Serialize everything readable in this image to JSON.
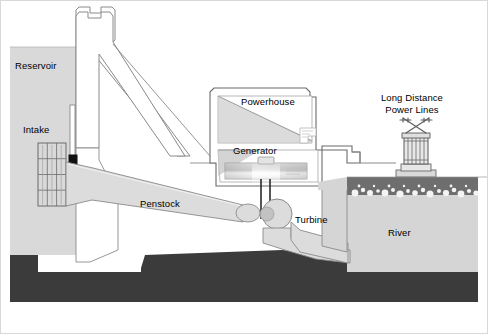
{
  "diagram": {
    "width": 488,
    "height": 334,
    "background": "#ffffff",
    "border_color": "#c8c8c8"
  },
  "labels": {
    "reservoir": "Reservoir",
    "intake": "Intake",
    "penstock": "Penstock",
    "powerhouse": "Powerhouse",
    "generator": "Generator",
    "turbine": "Turbine",
    "river": "River",
    "power_lines_line1": "Long Distance",
    "power_lines_line2": "Power Lines"
  },
  "colors": {
    "water_light": "#d9d9d9",
    "water_dark": "#6e6e6e",
    "bedrock": "#3b3b3b",
    "ground": "#b5b5b5",
    "outline": "#6b6b6b",
    "structure_fill": "#ffffff",
    "concrete": "#d2d2d2",
    "generator_grad_start": "#bdbdbd",
    "generator_grad_end": "#f2f2f2",
    "foam": "#f2f2f2",
    "text": "#000000"
  },
  "components": [
    {
      "name": "reservoir",
      "type": "water-body",
      "label": "Reservoir"
    },
    {
      "name": "dam-wall",
      "type": "structure"
    },
    {
      "name": "intake-grating",
      "type": "structure",
      "columns": 3,
      "rows": 4
    },
    {
      "name": "intake-gate",
      "type": "gate"
    },
    {
      "name": "penstock",
      "type": "conduit",
      "label": "Penstock"
    },
    {
      "name": "powerhouse",
      "type": "building",
      "label": "Powerhouse"
    },
    {
      "name": "generator",
      "type": "machine",
      "label": "Generator"
    },
    {
      "name": "turbine",
      "type": "machine",
      "label": "Turbine"
    },
    {
      "name": "draft-tube",
      "type": "conduit"
    },
    {
      "name": "river",
      "type": "water-body",
      "label": "River"
    },
    {
      "name": "transmission-tower",
      "type": "structure",
      "label": "Long Distance Power Lines"
    },
    {
      "name": "bedrock",
      "type": "terrain"
    }
  ]
}
